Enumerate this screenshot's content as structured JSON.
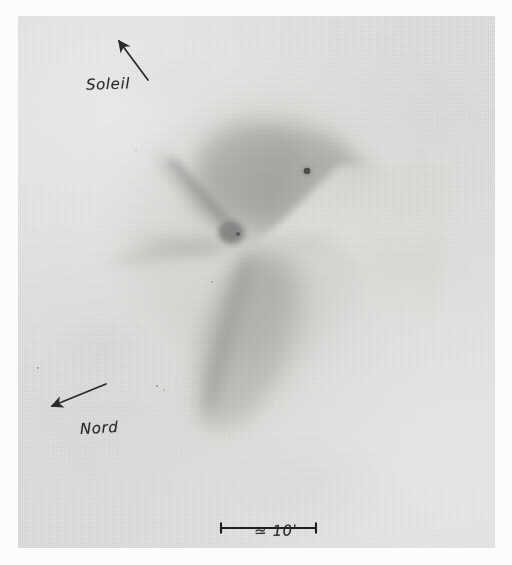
{
  "document": {
    "kind": "scanned-astronomical-plate",
    "subject": "comet",
    "medium": "photographic print with hand-drawn ink annotations",
    "page_background": "#fcfcfb",
    "plate_background": "#e2e2e0",
    "ink_color": "#2a2a2c"
  },
  "annotations": {
    "sun_direction": {
      "label": "Soleil",
      "arrow_from": [
        148,
        80
      ],
      "arrow_to": [
        119,
        41
      ],
      "meaning": "direction toward the Sun (up-right)"
    },
    "north_direction": {
      "label": "Nord",
      "arrow_from": [
        106,
        384
      ],
      "arrow_to": [
        50,
        406
      ],
      "meaning": "direction toward celestial north (down-left)"
    },
    "scale_bar": {
      "label": "≃ 10'",
      "value": 10,
      "unit": "arcminutes",
      "x_start": 221,
      "x_end": 316,
      "y": 528,
      "cap_height": 11
    }
  },
  "features": {
    "nucleus": {
      "name": "nucleus",
      "x": 232,
      "y": 233,
      "color": "#6d6d6c"
    },
    "field_star": {
      "name": "field-star",
      "x": 307,
      "y": 171,
      "color": "#23231f"
    },
    "coma": {
      "name": "coma",
      "cx": 248,
      "cy": 180,
      "rx": 88,
      "ry": 62
    },
    "jets": [
      "sunward-fan",
      "west-fan",
      "southern-tail"
    ],
    "tail": {
      "name": "dust-tail",
      "direction": "south / down-left",
      "extent_y": 420
    }
  },
  "plate_bounds": {
    "left": 18,
    "top": 16,
    "width": 477,
    "height": 532
  }
}
